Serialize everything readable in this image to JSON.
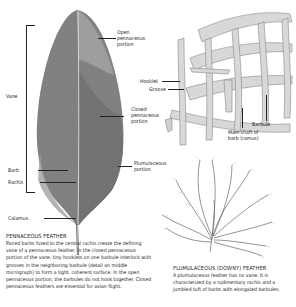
{
  "labels": {
    "open_pennaceous": "Open\npennaceous\nportion",
    "vane": "Vane",
    "closed_pennaceous": "Closed\npennaceous\nportion",
    "plumulaceous_portion": "Plumulaceous\nportion",
    "barb": "Barb",
    "rachis": "Rachis",
    "calamus": "Calamus",
    "hooklet": "Hooklet",
    "groove": "Groove",
    "barbule": "Barbule",
    "main_shaft": "Main shaft of\nbarb (ramus)"
  },
  "pennaceous": {
    "heading": "PENNACEOUS FEATHER",
    "text": "Paired barbs fused to the central rachis create the defining vane of a pennaceous feather. In the closed pennaceous portion of the vane, tiny hooklets on one barbule interlock with grooves in the neighboring barbule (detail an  middle micrograph) to form a tight, coherent surface. In the open pennaceous portion, the barbules do not hook together. Closed pennaceous feathers are essential for avian flight."
  },
  "plumulaceous": {
    "heading": "PLUMULACEOUS (DOWNY) FEATHER",
    "text": "A plumulaceous feather has no vane. It is characterized by a rudimentary rachis and a jumbled tuft of barbs with elongated barbules."
  },
  "colors": {
    "ink": "#222222",
    "feather_dark": "#6b6b6b",
    "feather_mid": "#8c8c8c",
    "feather_light": "#b5b5b5",
    "barb_fill": "#d6d6d6"
  }
}
